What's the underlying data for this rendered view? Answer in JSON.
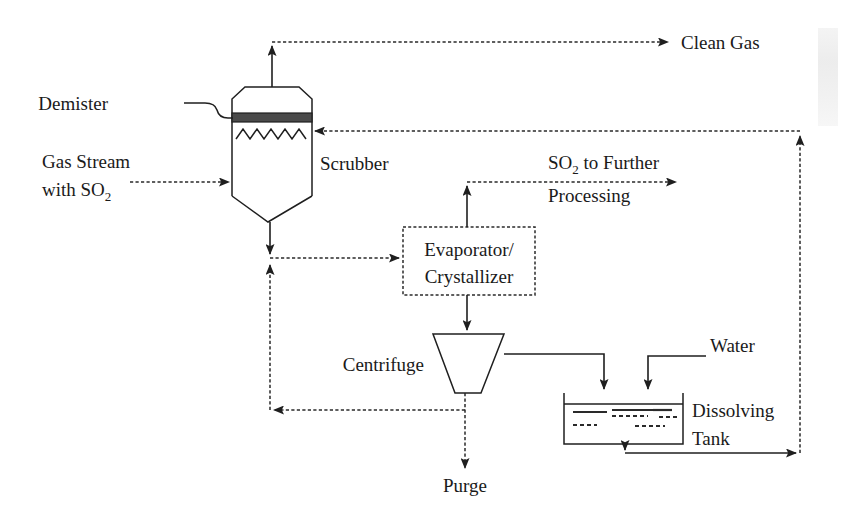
{
  "diagram": {
    "background_color": "#ffffff",
    "line_color": "#1f1f1f",
    "demister_fill": "#4a4a4a",
    "labels": {
      "demister": "Demister",
      "scrubber": "Scrubber",
      "gas_stream_line1": "Gas Stream",
      "gas_stream_line2_prefix": "with SO",
      "gas_stream_line2_sub": "2",
      "clean_gas": "Clean Gas",
      "so2_further_prefix": "SO",
      "so2_further_sub": "2",
      "so2_further_suffix": " to Further",
      "so2_further_line2": "Processing",
      "evaporator_line1": "Evaporator/",
      "evaporator_line2": "Crystallizer",
      "centrifuge": "Centrifuge",
      "purge": "Purge",
      "water": "Water",
      "dissolving_tank_line1": "Dissolving",
      "dissolving_tank_line2": "Tank"
    },
    "equipment": [
      {
        "id": "scrubber",
        "name": "Scrubber",
        "type": "vessel"
      },
      {
        "id": "demister",
        "name": "Demister",
        "type": "internal-band"
      },
      {
        "id": "evaporator-crystallizer",
        "name": "Evaporator/Crystallizer",
        "type": "box"
      },
      {
        "id": "centrifuge",
        "name": "Centrifuge",
        "type": "trapezoid"
      },
      {
        "id": "dissolving-tank",
        "name": "Dissolving Tank",
        "type": "open-tank"
      }
    ],
    "streams": [
      {
        "id": "gas-in",
        "name": "Gas Stream with SO2",
        "style": "dashed",
        "from": "inlet",
        "to": "scrubber"
      },
      {
        "id": "clean-gas-out",
        "name": "Clean Gas",
        "style": "dashed",
        "from": "scrubber",
        "to": "outlet"
      },
      {
        "id": "scrubber-bottoms",
        "name": "Scrubber bottoms",
        "style": "solid",
        "from": "scrubber",
        "to": "junction"
      },
      {
        "id": "to-evaporator",
        "name": "Feed to evaporator",
        "style": "dashed",
        "from": "junction",
        "to": "evaporator-crystallizer"
      },
      {
        "id": "so2-to-further",
        "name": "SO2 to Further Processing",
        "style": "dashed",
        "from": "evaporator-crystallizer",
        "to": "outlet"
      },
      {
        "id": "evap-to-centrifuge",
        "name": "Slurry to centrifuge",
        "style": "solid",
        "from": "evaporator-crystallizer",
        "to": "centrifuge"
      },
      {
        "id": "centrifuge-liquor",
        "name": "Centrifuge mother liquor recycle",
        "style": "dashed",
        "from": "centrifuge",
        "to": "junction"
      },
      {
        "id": "purge",
        "name": "Purge",
        "style": "dashed",
        "from": "centrifuge",
        "to": "outlet"
      },
      {
        "id": "cake-to-tank",
        "name": "Cake to dissolving tank",
        "style": "solid",
        "from": "centrifuge",
        "to": "dissolving-tank"
      },
      {
        "id": "water-in",
        "name": "Water",
        "style": "solid",
        "from": "inlet",
        "to": "dissolving-tank"
      },
      {
        "id": "tank-recycle",
        "name": "Solution recycle to scrubber",
        "style": "solid",
        "from": "dissolving-tank",
        "to": "scrubber"
      }
    ]
  }
}
